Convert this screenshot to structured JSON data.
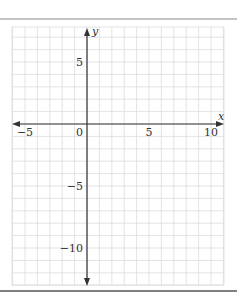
{
  "figure": {
    "type": "coordinate-grid",
    "colors": {
      "rule": "#8a8a8a",
      "grid": "#dcdcdc",
      "axis": "#333333",
      "label": "#333333"
    }
  },
  "axes": {
    "x_label": "x",
    "y_label": "y",
    "x_range": [
      -6,
      11
    ],
    "y_range": [
      -13,
      7.8
    ],
    "x_ticks": [
      {
        "value": -5,
        "label": "−5"
      },
      {
        "value": 0,
        "label": "0"
      },
      {
        "value": 5,
        "label": "5"
      },
      {
        "value": 10,
        "label": "10"
      }
    ],
    "y_ticks": [
      {
        "value": 5,
        "label": "5"
      },
      {
        "value": -5,
        "label": "−5"
      },
      {
        "value": -10,
        "label": "−10"
      }
    ],
    "grid_step": 1
  },
  "chart_data": {
    "type": "scatter",
    "title": "",
    "xlabel": "x",
    "ylabel": "y",
    "xlim": [
      -6,
      11
    ],
    "ylim": [
      -13,
      7.8
    ],
    "x_tick_labels": [
      "-5",
      "0",
      "5",
      "10"
    ],
    "y_tick_labels": [
      "5",
      "-5",
      "-10"
    ],
    "grid": true,
    "series": []
  }
}
